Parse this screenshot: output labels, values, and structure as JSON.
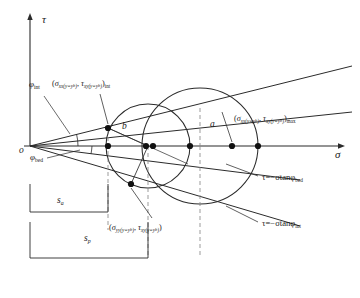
{
  "figure": {
    "type": "mohr-circle-diagram",
    "background": "#ffffff",
    "line_color": "#2b2b2b",
    "dashed_color": "#8a8a8a"
  },
  "axes": {
    "x_label": "σ",
    "y_label": "τ",
    "origin_label": "o",
    "x_axis_y": 146,
    "y_axis_x": 30,
    "x_start": 22,
    "x_end": 345,
    "y_top": 14,
    "y_bottom": 146
  },
  "envelopes": [
    {
      "name": "internal-friction-envelope",
      "equation_prefix": "τ=−σtanφ",
      "equation_subscript": "int",
      "angle_label": "φ",
      "angle_subscript": "int",
      "label_x": 262,
      "label_y": 219
    },
    {
      "name": "bedding-plane-envelope",
      "equation_prefix": "τ=−σtanφ",
      "equation_subscript": "bed",
      "angle_label": "φ",
      "angle_subscript": "bed",
      "label_x": 262,
      "label_y": 173
    }
  ],
  "angle_labels": [
    {
      "name": "phi-int-angle",
      "base": "φ",
      "sub": "int",
      "x": 29,
      "y": 86
    },
    {
      "name": "phi-bed-angle",
      "base": "φ",
      "sub": "bed",
      "x": 30,
      "y": 159
    }
  ],
  "circles": [
    {
      "name": "mohr-circle-b",
      "label": "b",
      "label_x": 125,
      "label_y": 128,
      "cx": 148,
      "cy": 146,
      "r": 42
    },
    {
      "name": "mohr-circle-a",
      "label": "a",
      "label_x": 212,
      "label_y": 126,
      "cx": 200,
      "cy": 146,
      "r": 58
    }
  ],
  "stress_points": [
    {
      "name": "stress-point-int-left",
      "sigma_base": "σ",
      "sigma_sub": "xx(y=y",
      "sigma_sub_tail": "b",
      "tau_base": "τ",
      "tau_sub": "xy(y=y",
      "tau_sub_tail": "b",
      "suffix": "int",
      "x": 52,
      "y": 80
    },
    {
      "name": "stress-point-max-right",
      "sigma_base": "σ",
      "sigma_sub": "xx(y=y",
      "sigma_sub_tail": "b",
      "tau_base": "τ",
      "tau_sub": "xy(y=y",
      "tau_sub_tail": "b",
      "suffix": "max",
      "x": 234,
      "y": 115
    },
    {
      "name": "stress-point-yy",
      "sigma_base": "σ",
      "sigma_sub": "yy(y=y",
      "sigma_sub_tail": "b",
      "tau_base": "τ",
      "tau_sub": "xy(y=y",
      "tau_sub_tail": "b",
      "suffix": "",
      "x": 109,
      "y": 224
    }
  ],
  "dimensions": [
    {
      "name": "dimension-s-a",
      "base": "s",
      "sub": "a",
      "x": 57,
      "y": 200
    },
    {
      "name": "dimension-s-p",
      "base": "s",
      "sub": "p",
      "x": 84,
      "y": 238
    }
  ]
}
